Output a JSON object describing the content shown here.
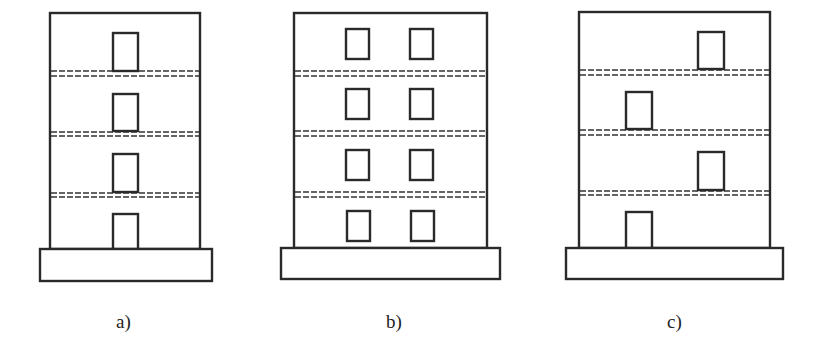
{
  "figure": {
    "panels": [
      {
        "id": "a",
        "label": "a)",
        "description": "Four-storey facade with a single centered opening per floor, aligned vertically",
        "storeys": 4,
        "openings_per_storey": 1,
        "layout": "aligned"
      },
      {
        "id": "b",
        "label": "b)",
        "description": "Four-storey facade with two openings per floor, aligned in two columns",
        "storeys": 4,
        "openings_per_storey": 2,
        "layout": "aligned-grid"
      },
      {
        "id": "c",
        "label": "c)",
        "description": "Four-storey facade with one opening per floor, staggered alternately left and right",
        "storeys": 4,
        "openings_per_storey": 1,
        "layout": "staggered"
      }
    ],
    "colors": {
      "line": "#2a2a2a",
      "background": "#ffffff"
    }
  }
}
